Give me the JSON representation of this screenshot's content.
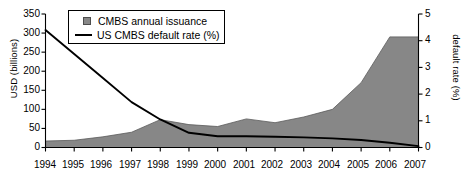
{
  "chart_data": {
    "type": "area",
    "title": "",
    "xlabel": "",
    "ylabel": "USD (billions)",
    "y2label": "default rate (%)",
    "grid": false,
    "legend_position": "top-left",
    "categories": [
      "1994",
      "1995",
      "1996",
      "1997",
      "1998",
      "1999",
      "2000",
      "2001",
      "2002",
      "2003",
      "2004",
      "2005",
      "2006",
      "2007"
    ],
    "ylim": [
      0,
      350
    ],
    "yticks": [
      0,
      50,
      100,
      150,
      200,
      250,
      300,
      350
    ],
    "y2lim": [
      0,
      5
    ],
    "y2ticks": [
      0,
      1,
      2,
      3,
      4,
      5
    ],
    "series": [
      {
        "name": "CMBS annual issuance",
        "axis": "left",
        "type": "area",
        "units": "USD (billions)",
        "color": "#878787",
        "values": [
          17,
          19,
          28,
          40,
          73,
          60,
          55,
          75,
          65,
          80,
          100,
          170,
          290,
          290
        ]
      },
      {
        "name": "US CMBS default rate (%)",
        "axis": "right",
        "type": "line",
        "units": "%",
        "color": "#000000",
        "values": [
          4.4,
          3.5,
          2.6,
          1.7,
          1.05,
          0.55,
          0.42,
          0.42,
          0.4,
          0.38,
          0.34,
          0.28,
          0.18,
          0.05
        ]
      }
    ]
  },
  "legend": {
    "items": [
      {
        "label": "CMBS annual issuance",
        "marker": "square-swatch"
      },
      {
        "label": "US CMBS default rate (%)",
        "marker": "line-swatch"
      }
    ]
  },
  "axes": {
    "left": {
      "title": "USD (billions)",
      "ticks": [
        "350",
        "300",
        "250",
        "200",
        "150",
        "100",
        "50",
        "0"
      ]
    },
    "right": {
      "title": "default rate (%)",
      "ticks": [
        "5",
        "4",
        "3",
        "2",
        "1",
        "0"
      ]
    },
    "bottom": {
      "ticks": [
        "1994",
        "1995",
        "1996",
        "1997",
        "1998",
        "1999",
        "2000",
        "2001",
        "2002",
        "2003",
        "2004",
        "2005",
        "2006",
        "2007"
      ]
    }
  }
}
